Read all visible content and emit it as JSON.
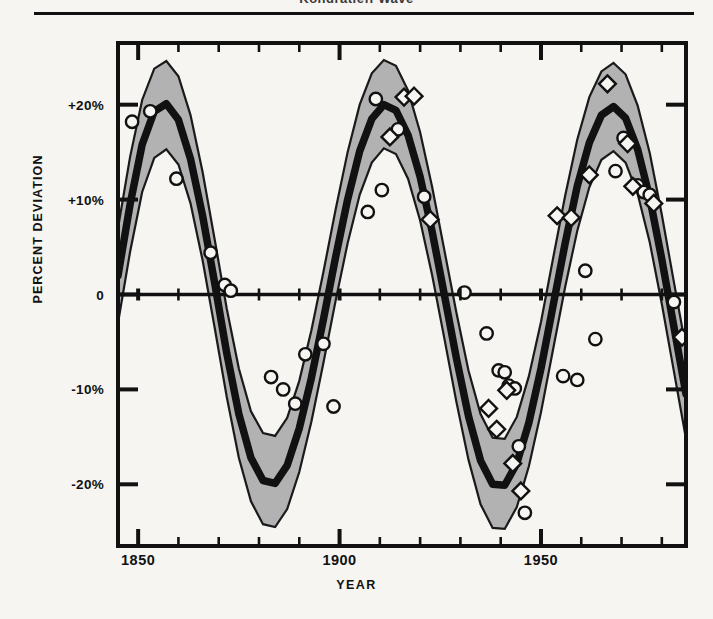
{
  "figure": {
    "caption_remnant": "Kondratieff Wave",
    "background": "#f6f5f2",
    "ink": "#111111",
    "band_fill": "#a8a8a8",
    "band_edge": "#1a1a1a",
    "marker_face": "#f6f5f2",
    "marker_edge": "#111111"
  },
  "axes": {
    "y_title": "PERCENT DEVIATION",
    "x_title": "YEAR",
    "y_tick_labels": [
      "+20%",
      "+10%",
      "0",
      "-10%",
      "-20%"
    ],
    "y_tick_values": [
      20,
      10,
      0,
      -10,
      -20
    ],
    "x_tick_labels": [
      "1850",
      "1900",
      "1950"
    ],
    "x_tick_values": [
      1850,
      1900,
      1950
    ],
    "x_minor_step": 10,
    "y_minor_step": 10
  },
  "chart_data": {
    "type": "line",
    "title": "Kondratieff Wave",
    "xlabel": "YEAR",
    "ylabel": "PERCENT DEVIATION",
    "xlim": [
      1845,
      1986
    ],
    "ylim": [
      -26.5,
      26.5
    ],
    "grid": false,
    "legend_position": "none",
    "x_ticks": [
      1850,
      1900,
      1950
    ],
    "y_ticks": [
      -20,
      -10,
      0,
      10,
      20
    ],
    "zero_line": true,
    "series": [
      {
        "name": "Fitted long-wave trend",
        "type": "line",
        "style": "thick-black-curve",
        "x": [
          1845,
          1848,
          1851,
          1854,
          1857,
          1860,
          1863,
          1866,
          1869,
          1872,
          1875,
          1878,
          1881,
          1884,
          1887,
          1890,
          1893,
          1896,
          1899,
          1902,
          1905,
          1908,
          1911,
          1914,
          1917,
          1920,
          1923,
          1926,
          1929,
          1932,
          1935,
          1938,
          1941,
          1944,
          1947,
          1950,
          1953,
          1956,
          1959,
          1962,
          1965,
          1968,
          1971,
          1974,
          1977,
          1980,
          1983,
          1986
        ],
        "values": [
          2.0,
          9.5,
          15.8,
          19.3,
          20.1,
          18.4,
          14.3,
          8.3,
          1.2,
          -6.2,
          -12.6,
          -17.2,
          -19.6,
          -19.9,
          -18.0,
          -14.1,
          -8.8,
          -2.6,
          3.9,
          10.0,
          15.1,
          18.5,
          20.0,
          19.4,
          16.8,
          12.4,
          6.6,
          0.0,
          -6.7,
          -12.8,
          -17.5,
          -20.0,
          -20.1,
          -17.8,
          -13.5,
          -7.8,
          -1.2,
          5.4,
          11.4,
          16.0,
          18.9,
          19.8,
          18.6,
          15.3,
          10.2,
          3.7,
          -3.4,
          -10.5
        ]
      },
      {
        "name": "Upper confidence bound",
        "type": "band-upper",
        "x": [
          1845,
          1848,
          1851,
          1854,
          1857,
          1860,
          1863,
          1866,
          1869,
          1872,
          1875,
          1878,
          1881,
          1884,
          1887,
          1890,
          1893,
          1896,
          1899,
          1902,
          1905,
          1908,
          1911,
          1914,
          1917,
          1920,
          1923,
          1926,
          1929,
          1932,
          1935,
          1938,
          1941,
          1944,
          1947,
          1950,
          1953,
          1956,
          1959,
          1962,
          1965,
          1968,
          1971,
          1974,
          1977,
          1980,
          1983,
          1986
        ],
        "values": [
          7.0,
          14.5,
          20.5,
          23.8,
          24.6,
          23.0,
          18.9,
          12.9,
          5.8,
          -1.5,
          -7.8,
          -12.3,
          -14.6,
          -14.9,
          -13.0,
          -9.1,
          -3.8,
          2.4,
          8.9,
          15.0,
          20.0,
          23.3,
          24.7,
          24.1,
          21.5,
          17.1,
          11.3,
          4.7,
          -1.9,
          -8.0,
          -12.6,
          -15.1,
          -15.2,
          -12.9,
          -8.6,
          -2.9,
          3.8,
          10.4,
          16.3,
          20.8,
          23.5,
          24.4,
          23.2,
          19.9,
          14.9,
          8.4,
          1.3,
          -5.7
        ]
      },
      {
        "name": "Lower confidence bound",
        "type": "band-lower",
        "x": [
          1845,
          1848,
          1851,
          1854,
          1857,
          1860,
          1863,
          1866,
          1869,
          1872,
          1875,
          1878,
          1881,
          1884,
          1887,
          1890,
          1893,
          1896,
          1899,
          1902,
          1905,
          1908,
          1911,
          1914,
          1917,
          1920,
          1923,
          1926,
          1929,
          1932,
          1935,
          1938,
          1941,
          1944,
          1947,
          1950,
          1953,
          1956,
          1959,
          1962,
          1965,
          1968,
          1971,
          1974,
          1977,
          1980,
          1983,
          1986
        ],
        "values": [
          -3.0,
          4.5,
          10.8,
          14.4,
          15.3,
          13.7,
          9.6,
          3.6,
          -3.5,
          -10.8,
          -17.2,
          -21.8,
          -24.2,
          -24.5,
          -22.6,
          -18.7,
          -13.4,
          -7.2,
          -0.7,
          5.4,
          10.5,
          13.9,
          15.4,
          14.8,
          12.2,
          7.8,
          2.0,
          -4.6,
          -11.3,
          -17.4,
          -22.1,
          -24.6,
          -24.7,
          -22.4,
          -18.1,
          -12.4,
          -5.8,
          0.8,
          6.7,
          11.3,
          14.2,
          15.1,
          13.9,
          10.6,
          5.5,
          -1.0,
          -8.1,
          -15.2
        ]
      },
      {
        "name": "Observations (circles)",
        "type": "scatter",
        "marker": "circle",
        "points": [
          [
            1848.5,
            18.2
          ],
          [
            1853.0,
            19.3
          ],
          [
            1859.5,
            12.2
          ],
          [
            1868.0,
            4.4
          ],
          [
            1871.5,
            1.0
          ],
          [
            1873.0,
            0.4
          ],
          [
            1883.0,
            -8.7
          ],
          [
            1886.0,
            -10.0
          ],
          [
            1889.0,
            -11.5
          ],
          [
            1891.5,
            -6.3
          ],
          [
            1896.0,
            -5.2
          ],
          [
            1898.5,
            -11.8
          ],
          [
            1907.0,
            8.7
          ],
          [
            1909.0,
            20.6
          ],
          [
            1910.5,
            11.0
          ],
          [
            1914.5,
            17.4
          ],
          [
            1921.0,
            10.3
          ],
          [
            1931.0,
            0.2
          ],
          [
            1936.5,
            -4.1
          ],
          [
            1939.5,
            -8.0
          ],
          [
            1941.0,
            -8.2
          ],
          [
            1942.0,
            -9.6
          ],
          [
            1943.5,
            -9.9
          ],
          [
            1944.5,
            -16.0
          ],
          [
            1946.0,
            -23.0
          ],
          [
            1955.5,
            -8.6
          ],
          [
            1959.0,
            -9.0
          ],
          [
            1961.0,
            2.5
          ],
          [
            1963.5,
            -4.7
          ],
          [
            1968.5,
            13.0
          ],
          [
            1970.5,
            16.5
          ],
          [
            1974.0,
            11.5
          ],
          [
            1975.5,
            10.8
          ],
          [
            1977.0,
            10.5
          ],
          [
            1983.0,
            -0.8
          ]
        ]
      },
      {
        "name": "Observations (diamonds)",
        "type": "scatter",
        "marker": "diamond",
        "points": [
          [
            1912.5,
            16.6
          ],
          [
            1916.0,
            20.8
          ],
          [
            1918.5,
            20.9
          ],
          [
            1922.5,
            7.9
          ],
          [
            1937.0,
            -12.0
          ],
          [
            1939.0,
            -14.2
          ],
          [
            1941.5,
            -10.1
          ],
          [
            1943.0,
            -17.8
          ],
          [
            1945.0,
            -20.7
          ],
          [
            1954.0,
            8.3
          ],
          [
            1957.5,
            8.1
          ],
          [
            1962.0,
            12.6
          ],
          [
            1966.5,
            22.2
          ],
          [
            1971.5,
            15.9
          ],
          [
            1972.8,
            11.4
          ],
          [
            1978.0,
            9.6
          ],
          [
            1985.0,
            -4.5
          ]
        ]
      }
    ]
  }
}
